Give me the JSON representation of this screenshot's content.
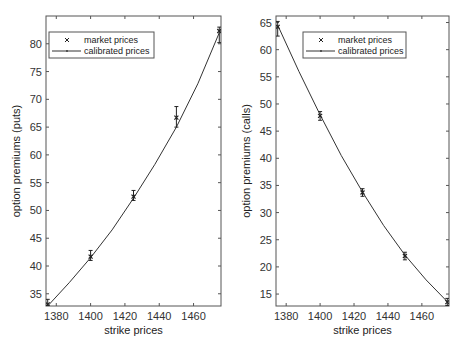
{
  "chart_data": [
    {
      "type": "line",
      "title": "",
      "xlabel": "strike prices",
      "ylabel": "option premiums (puts)",
      "xlim": [
        1374,
        1476
      ],
      "ylim": [
        32.8,
        85
      ],
      "xticks": [
        1380,
        1400,
        1420,
        1440,
        1460
      ],
      "yticks": [
        35,
        40,
        45,
        50,
        55,
        60,
        65,
        70,
        75,
        80
      ],
      "grid": false,
      "legend_position": "upper left",
      "legend": [
        "market prices",
        "calibrated prices"
      ],
      "series": [
        {
          "name": "market prices",
          "style": "x-marker with error bars",
          "x": [
            1375,
            1400,
            1425,
            1450,
            1475
          ],
          "y": [
            33.1,
            41.7,
            52.5,
            66.7,
            82.3
          ],
          "err_low": [
            32.8,
            41.0,
            51.8,
            65.0,
            80.2
          ],
          "err_high": [
            34.0,
            42.8,
            53.6,
            68.7,
            83.0
          ]
        },
        {
          "name": "calibrated prices",
          "style": "solid line",
          "x": [
            1375,
            1387.5,
            1400,
            1412.5,
            1425,
            1437.5,
            1450,
            1462.5,
            1475
          ],
          "y": [
            32.8,
            37.0,
            41.5,
            46.5,
            52.2,
            58.3,
            65.0,
            72.8,
            82.0
          ]
        }
      ]
    },
    {
      "type": "line",
      "title": "",
      "xlabel": "strike prices",
      "ylabel": "option premiums (calls)",
      "xlim": [
        1374,
        1476
      ],
      "ylim": [
        12.8,
        66.2
      ],
      "xticks": [
        1380,
        1400,
        1420,
        1440,
        1460
      ],
      "yticks": [
        15,
        20,
        25,
        30,
        35,
        40,
        45,
        50,
        55,
        60,
        65
      ],
      "grid": false,
      "legend_position": "upper center",
      "legend": [
        "market prices",
        "calibrated prices"
      ],
      "series": [
        {
          "name": "market prices",
          "style": "x-marker with error bars",
          "x": [
            1375,
            1400,
            1425,
            1450,
            1475
          ],
          "y": [
            64.2,
            47.8,
            33.7,
            22.0,
            13.5
          ],
          "err_low": [
            62.5,
            47.0,
            33.0,
            21.3,
            12.9
          ],
          "err_high": [
            65.2,
            48.6,
            34.4,
            22.7,
            14.2
          ]
        },
        {
          "name": "calibrated prices",
          "style": "solid line",
          "x": [
            1375,
            1387.5,
            1400,
            1412.5,
            1425,
            1437.5,
            1450,
            1462.5,
            1475
          ],
          "y": [
            64.5,
            56.0,
            48.0,
            40.5,
            33.8,
            27.6,
            22.2,
            17.6,
            13.6
          ]
        }
      ]
    }
  ],
  "plots": [
    {
      "xlabel": "strike prices",
      "ylabel": "option premiums (puts)",
      "legend": {
        "market": "market prices",
        "calibrated": "calibrated prices"
      },
      "xtick_labels": [
        "1380",
        "1400",
        "1420",
        "1440",
        "1460"
      ],
      "ytick_labels": [
        "35",
        "40",
        "45",
        "50",
        "55",
        "60",
        "65",
        "70",
        "75",
        "80"
      ]
    },
    {
      "xlabel": "strike prices",
      "ylabel": "option premiums (calls)",
      "legend": {
        "market": "market prices",
        "calibrated": "calibrated prices"
      },
      "xtick_labels": [
        "1380",
        "1400",
        "1420",
        "1440",
        "1460"
      ],
      "ytick_labels": [
        "15",
        "20",
        "25",
        "30",
        "35",
        "40",
        "45",
        "50",
        "55",
        "60",
        "65"
      ]
    }
  ],
  "colors": {
    "line": "#333333",
    "frame": "#555555",
    "marker": "#222222"
  }
}
